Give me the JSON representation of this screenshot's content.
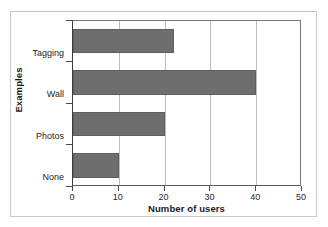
{
  "chart_data": {
    "type": "bar",
    "orientation": "horizontal",
    "title": "",
    "xlabel": "Number of users",
    "ylabel": "Examples",
    "categories": [
      "None",
      "Photos",
      "Wall",
      "Tagging"
    ],
    "values": [
      10,
      20,
      40,
      22
    ],
    "xlim": [
      0,
      50
    ],
    "xticks": [
      0,
      10,
      20,
      30,
      40,
      50
    ],
    "xtick_labels": [
      "0",
      "10",
      "20",
      "30",
      "40",
      "50"
    ],
    "grid": "vertical",
    "legend": "none",
    "series": [
      {
        "name": "Number of users",
        "values": [
          10,
          20,
          40,
          22
        ]
      }
    ],
    "bar_color": "#6e6e6e",
    "gridline_color": "#bdbdbd",
    "axis_color": "#4a4a4a",
    "frame_color": "#c9c9c9",
    "background": "#ffffff"
  }
}
